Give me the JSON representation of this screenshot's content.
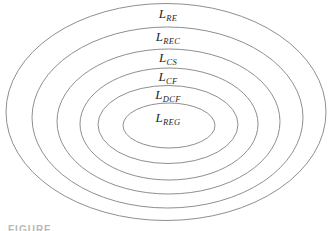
{
  "diagram": {
    "type": "nested-ellipses",
    "line_color": "#8f8f8f",
    "label_color": "#1f1f1f",
    "labels": [
      {
        "base": "L",
        "sub": "RE"
      },
      {
        "base": "L",
        "sub": "REC"
      },
      {
        "base": "L",
        "sub": "CS"
      },
      {
        "base": "L",
        "sub": "CF"
      },
      {
        "base": "L",
        "sub": "DCF"
      },
      {
        "base": "L",
        "sub": "REG"
      }
    ],
    "caption": "FIGURE"
  }
}
